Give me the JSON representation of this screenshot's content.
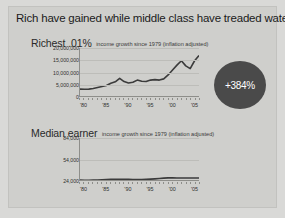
{
  "slide": {
    "title": "Rich have gained while middle class have treaded water",
    "background_color": "#cfcfcc",
    "badge_color": "#4a4a4a"
  },
  "sections": [
    {
      "name": "Richest .01%",
      "subtitle": "income growth since 1979 (inflation adjusted)",
      "badge": "+384%"
    },
    {
      "name": "Median earner",
      "subtitle": "income growth since 1979 (inflation adjusted)",
      "badge": "+12%"
    }
  ],
  "chart_data": [
    {
      "type": "line",
      "title": "Richest .01%",
      "subtitle": "income growth since 1979 (inflation adjusted)",
      "xlabel": "",
      "ylabel": "",
      "grid": true,
      "legend": "none",
      "annotation": "+384%",
      "ylim": [
        0,
        20000000
      ],
      "yticks": [
        0,
        5000000,
        10000000,
        15000000,
        20000000
      ],
      "ytick_labels": [
        "0",
        "5,000,000",
        "10,000,000",
        "15,000,000",
        "20,000,000"
      ],
      "xlim": [
        1979,
        2006
      ],
      "xticks": [
        1980,
        1985,
        1990,
        1995,
        2000,
        2005
      ],
      "xtick_labels": [
        "'80",
        "'85",
        "'90",
        "'95",
        "'00",
        "'05"
      ],
      "x": [
        1979,
        1980,
        1981,
        1982,
        1983,
        1984,
        1985,
        1986,
        1987,
        1988,
        1989,
        1990,
        1991,
        1992,
        1993,
        1994,
        1995,
        1996,
        1997,
        1998,
        1999,
        2000,
        2001,
        2002,
        2003,
        2004,
        2005,
        2006
      ],
      "values": [
        3200000,
        3150000,
        3200000,
        3500000,
        3900000,
        4300000,
        4700000,
        5600000,
        6200000,
        7600000,
        6300000,
        5700000,
        6000000,
        6900000,
        6400000,
        6300000,
        6900000,
        7100000,
        6900000,
        7400000,
        9000000,
        11000000,
        13000000,
        14800000,
        12700000,
        11600000,
        14800000,
        16900000
      ]
    },
    {
      "type": "line",
      "title": "Median earner",
      "subtitle": "income growth since 1979 (inflation adjusted)",
      "xlabel": "",
      "ylabel": "",
      "grid": true,
      "legend": "none",
      "annotation": "+12%",
      "ylim": [
        24000,
        84000
      ],
      "yticks": [
        24000,
        54000,
        84000
      ],
      "ytick_labels": [
        "24,000",
        "54,000",
        "84,000"
      ],
      "xlim": [
        1979,
        2006
      ],
      "xticks": [
        1980,
        1985,
        1990,
        1995,
        2000,
        2005
      ],
      "xtick_labels": [
        "'80",
        "'85",
        "'90",
        "'95",
        "'00",
        "'05"
      ],
      "x": [
        1979,
        1980,
        1981,
        1982,
        1983,
        1984,
        1985,
        1986,
        1987,
        1988,
        1989,
        1990,
        1991,
        1992,
        1993,
        1994,
        1995,
        1996,
        1997,
        1998,
        1999,
        2000,
        2001,
        2002,
        2003,
        2004,
        2005,
        2006
      ],
      "values": [
        25200,
        25000,
        25100,
        25300,
        25500,
        25800,
        26000,
        26200,
        26300,
        26400,
        26500,
        26300,
        26100,
        26000,
        26100,
        26300,
        26600,
        27000,
        27500,
        28000,
        28300,
        28400,
        28200,
        28100,
        28100,
        28200,
        28200,
        28200
      ]
    }
  ]
}
